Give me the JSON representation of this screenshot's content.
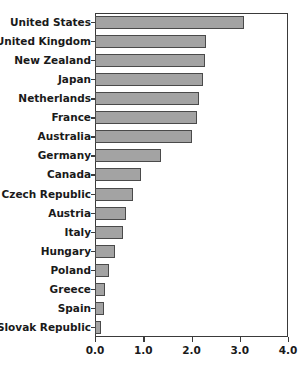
{
  "chart_data": {
    "type": "bar",
    "orientation": "horizontal",
    "title": "",
    "xlabel": "",
    "ylabel": "",
    "xlim": [
      0.0,
      4.0
    ],
    "xticks": [
      "0.0",
      "1.0",
      "2.0",
      "3.0",
      "4.0"
    ],
    "xtick_values": [
      0.0,
      1.0,
      2.0,
      3.0,
      4.0
    ],
    "grid": false,
    "legend": null,
    "bar_color": "#a3a3a3",
    "bar_edge_color": "#4a4a4a",
    "axis_color": "#3a3a3a",
    "background": "#ffffff",
    "categories": [
      "United States",
      "United Kingdom",
      "New Zealand",
      "Japan",
      "Netherlands",
      "France",
      "Australia",
      "Germany",
      "Canada",
      "Czech Republic",
      "Austria",
      "Italy",
      "Hungary",
      "Poland",
      "Greece",
      "Spain",
      "Slovak Republic"
    ],
    "values": [
      3.08,
      2.31,
      2.29,
      2.23,
      2.15,
      2.12,
      2.0,
      1.36,
      0.95,
      0.79,
      0.65,
      0.59,
      0.41,
      0.29,
      0.21,
      0.19,
      0.13
    ]
  }
}
